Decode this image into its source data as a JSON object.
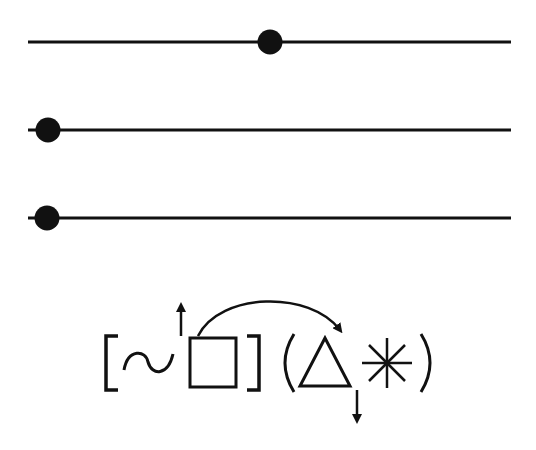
{
  "diagram": {
    "type": "slider-tracks-and-symbol-expression",
    "colors": {
      "stroke": "#111111",
      "background": "#ffffff"
    },
    "tracks": [
      {
        "name": "track-1",
        "y": 42,
        "x_start": 28,
        "x_end": 511,
        "dot_x": 270
      },
      {
        "name": "track-2",
        "y": 130,
        "x_start": 28,
        "x_end": 511,
        "dot_x": 48
      },
      {
        "name": "track-3",
        "y": 218,
        "x_start": 28,
        "x_end": 511,
        "dot_x": 47
      }
    ],
    "expression": {
      "tokens": [
        "[",
        "~",
        "square",
        "]",
        "(",
        "triangle",
        "asterisk",
        ")"
      ],
      "glyph_labels": {
        "open_bracket": "[",
        "close_bracket": "]",
        "open_paren": "(",
        "close_paren": ")"
      },
      "annotations": [
        {
          "name": "up-arrow",
          "direction": "up",
          "attached_to": "square"
        },
        {
          "name": "curved-arrow",
          "from": "square",
          "to": "triangle"
        },
        {
          "name": "down-arrow",
          "direction": "down",
          "attached_to": "triangle"
        }
      ]
    }
  }
}
